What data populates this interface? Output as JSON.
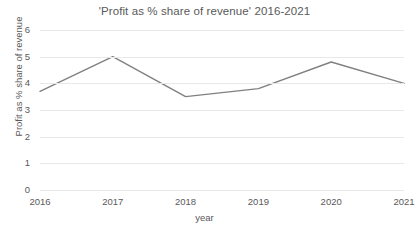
{
  "chart_data": {
    "type": "line",
    "title": "'Profit as % share of revenue' 2016-2021",
    "xlabel": "year",
    "ylabel": "Profit as % share of revenue",
    "categories": [
      "2016",
      "2017",
      "2018",
      "2019",
      "2020",
      "2021"
    ],
    "values": [
      3.7,
      5.0,
      3.5,
      3.8,
      4.8,
      4.0
    ],
    "series": [
      {
        "name": "Profit as % share of revenue",
        "values": [
          3.7,
          5.0,
          3.5,
          3.8,
          4.8,
          4.0
        ]
      }
    ],
    "ylim": [
      0,
      6
    ],
    "y_ticks": [
      "0",
      "1",
      "2",
      "3",
      "4",
      "5",
      "6"
    ],
    "y_tick_values": [
      0,
      1,
      2,
      3,
      4,
      5,
      6
    ],
    "x_ticks": [
      "2016",
      "2017",
      "2018",
      "2019",
      "2020",
      "2021"
    ],
    "grid": true,
    "grid_axis": "y",
    "legend": false,
    "legend_position": "none",
    "markers": false,
    "line_color": "#808080",
    "gridline_color": "#E8E8E8",
    "text_color": "#595959",
    "background_color": "#FFFFFF"
  }
}
